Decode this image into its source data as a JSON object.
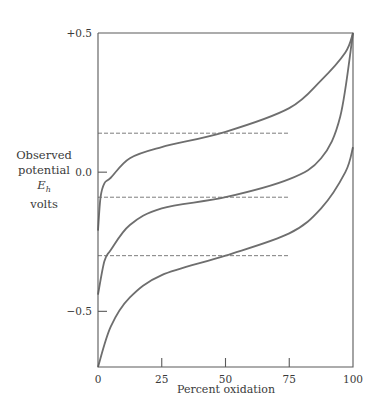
{
  "chart_data": {
    "type": "line",
    "title": "",
    "xlabel": "Percent oxidation",
    "ylabel": {
      "line1": "Observed",
      "line2": "potential",
      "symbol": "E",
      "subscript": "h",
      "line4": "volts"
    },
    "xlim": [
      0,
      100
    ],
    "ylim": [
      -0.7,
      0.5
    ],
    "x_ticks": [
      0,
      25,
      50,
      75,
      100
    ],
    "x_tick_labels": [
      "0",
      "25",
      "50",
      "75",
      "100"
    ],
    "y_ticks": [
      0.5,
      0.0,
      -0.5
    ],
    "y_tick_labels": [
      "+0.5",
      "0.0",
      "−0.5"
    ],
    "grid": false,
    "legend": null,
    "series": [
      {
        "name": "curve-1",
        "x": [
          0,
          1,
          2.5,
          5,
          12.5,
          25,
          50,
          75,
          87.5,
          97,
          100
        ],
        "values": [
          -0.21,
          -0.09,
          -0.04,
          -0.02,
          0.05,
          0.09,
          0.145,
          0.23,
          0.33,
          0.43,
          0.5
        ]
      },
      {
        "name": "curve-2",
        "x": [
          0,
          2.5,
          5,
          12.5,
          25,
          50,
          75,
          87.5,
          95,
          100
        ],
        "values": [
          -0.44,
          -0.32,
          -0.28,
          -0.19,
          -0.13,
          -0.09,
          -0.025,
          0.05,
          0.2,
          0.5
        ]
      },
      {
        "name": "curve-3",
        "x": [
          0,
          5,
          12.5,
          25,
          50,
          75,
          87.5,
          97,
          100
        ],
        "values": [
          -0.7,
          -0.555,
          -0.45,
          -0.37,
          -0.3,
          -0.22,
          -0.13,
          0.0,
          0.09
        ]
      }
    ],
    "reference_lines": [
      {
        "name": "midpoint-1",
        "y": 0.14,
        "x_start": 0,
        "x_end": 75,
        "style": "dashed"
      },
      {
        "name": "midpoint-2",
        "y": -0.09,
        "x_start": 0,
        "x_end": 75,
        "style": "dashed"
      },
      {
        "name": "midpoint-3",
        "y": -0.3,
        "x_start": 0,
        "x_end": 75,
        "style": "dashed"
      }
    ],
    "colors": {
      "axis": "#5a5a5a",
      "curve": "#6e6e6e",
      "dashed": "#6e6e6e",
      "text": "#3a3a3a"
    }
  }
}
